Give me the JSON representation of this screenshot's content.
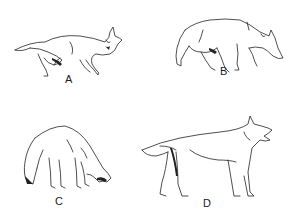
{
  "figure": {
    "type": "animal posture illustrations",
    "panels": [
      {
        "id": "A",
        "label": "A",
        "posture": "lying on side / rolling over"
      },
      {
        "id": "B",
        "label": "B",
        "posture": "walking, head lowered"
      },
      {
        "id": "C",
        "label": "C",
        "posture": "crouched, head down, tail tucked"
      },
      {
        "id": "D",
        "label": "D",
        "posture": "standing erect, mouth open snarling"
      }
    ]
  },
  "colors": {
    "background": "#ffffff",
    "ink": "#222222"
  }
}
